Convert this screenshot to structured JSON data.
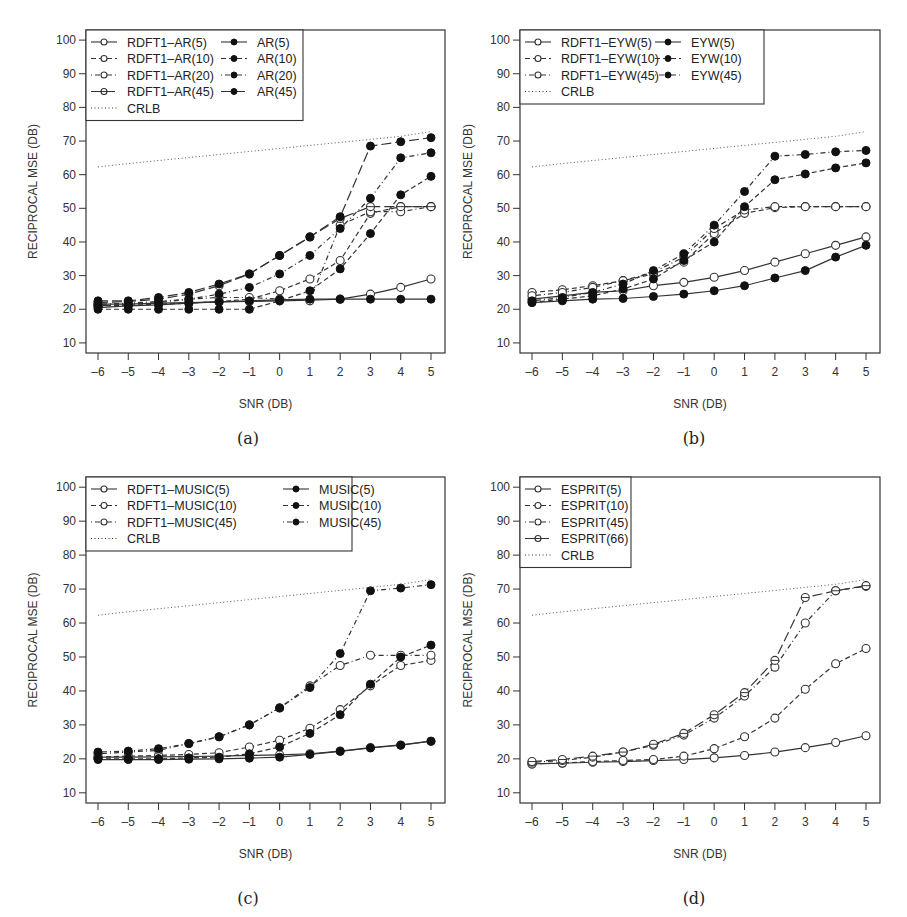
{
  "chart_data": [
    {
      "id": "a",
      "type": "line",
      "caption": "(a)",
      "xlabel": "SNR (DB)",
      "ylabel": "RECIPROCAL MSE (DB)",
      "x": [
        -6,
        -5,
        -4,
        -3,
        -2,
        -1,
        0,
        1,
        2,
        3,
        4,
        5
      ],
      "xticks": [
        "-6",
        "-5",
        "-4",
        "-3",
        "-2",
        "-1",
        "0",
        "1",
        "2",
        "3",
        "4",
        "5"
      ],
      "yticks": [
        "10",
        "20",
        "30",
        "40",
        "50",
        "60",
        "70",
        "80",
        "90",
        "100"
      ],
      "ylim": [
        7,
        103
      ],
      "grid": false,
      "legend_position": "top-left",
      "legend_columns": 2,
      "series": [
        {
          "name": "RDFT1-AR(5)",
          "marker": "open",
          "dash": "solid",
          "legend_col": 0,
          "legend_row": 0,
          "values": [
            21.5,
            21.5,
            21.8,
            22,
            22.2,
            22.3,
            22.5,
            22.7,
            23,
            24.5,
            26.5,
            29
          ]
        },
        {
          "name": "RDFT1-AR(10)",
          "marker": "open",
          "dash": "dashed",
          "legend_col": 0,
          "legend_row": 1,
          "values": [
            21,
            21.2,
            21.5,
            21.8,
            22.3,
            23,
            25.5,
            29,
            34.5,
            48.5,
            50.5,
            50.5
          ]
        },
        {
          "name": "RDFT1-AR(20)",
          "marker": "open",
          "dash": "dotdash",
          "legend_col": 0,
          "legend_row": 2,
          "values": [
            21.5,
            21.8,
            22.3,
            23,
            23.5,
            23.5,
            23,
            22.5,
            45,
            49,
            49,
            50.5
          ]
        },
        {
          "name": "RDFT1-AR(45)",
          "marker": "half",
          "dash": "longdash",
          "legend_col": 0,
          "legend_row": 3,
          "values": [
            22,
            22.3,
            23,
            24.5,
            27,
            30.5,
            36,
            41.5,
            47,
            50.5,
            50.5,
            50.5
          ]
        },
        {
          "name": "AR(5)",
          "marker": "filled",
          "dash": "solid",
          "legend_col": 1,
          "legend_row": 0,
          "values": [
            20.5,
            21,
            21.3,
            21.8,
            22.2,
            22.5,
            22.8,
            23,
            23,
            23,
            23,
            23
          ]
        },
        {
          "name": "AR(10)",
          "marker": "filled",
          "dash": "dashed",
          "legend_col": 1,
          "legend_row": 1,
          "values": [
            20,
            20,
            20,
            20,
            20,
            20,
            22.5,
            25.5,
            32,
            42.5,
            54,
            59.5
          ]
        },
        {
          "name": "AR(20)",
          "marker": "filled",
          "dash": "dotdash",
          "legend_col": 1,
          "legend_row": 2,
          "values": [
            21,
            21.5,
            22,
            23,
            24.5,
            26.5,
            30.5,
            36,
            44,
            53,
            65,
            66.5
          ]
        },
        {
          "name": "AR(45)",
          "marker": "filled",
          "dash": "longdash",
          "legend_col": 1,
          "legend_row": 3,
          "values": [
            22.5,
            22.5,
            23.5,
            25,
            27.5,
            30.5,
            36,
            41.5,
            47.5,
            68.5,
            69.8,
            71
          ]
        },
        {
          "name": "CRLB",
          "marker": "none",
          "dash": "dotted",
          "legend_col": 0,
          "legend_row": 4,
          "values": [
            62.3,
            63.3,
            64.2,
            65.1,
            66,
            66.9,
            67.8,
            68.7,
            69.6,
            70.5,
            71.4,
            72.8
          ]
        }
      ]
    },
    {
      "id": "b",
      "type": "line",
      "caption": "(b)",
      "xlabel": "SNR (DB)",
      "ylabel": "RECIPROCAL MSE (DB)",
      "x": [
        -6,
        -5,
        -4,
        -3,
        -2,
        -1,
        0,
        1,
        2,
        3,
        4,
        5
      ],
      "xticks": [
        "-6",
        "-5",
        "-4",
        "-3",
        "-2",
        "-1",
        "0",
        "1",
        "2",
        "3",
        "4",
        "5"
      ],
      "yticks": [
        "10",
        "20",
        "30",
        "40",
        "50",
        "60",
        "70",
        "80",
        "90",
        "100"
      ],
      "ylim": [
        7,
        103
      ],
      "grid": false,
      "legend_position": "top-left",
      "legend_columns": 2,
      "series": [
        {
          "name": "RDFT1-EYW(5)",
          "marker": "open",
          "dash": "solid",
          "legend_col": 0,
          "legend_row": 0,
          "values": [
            23,
            24,
            25,
            25.5,
            27,
            28,
            29.5,
            31.5,
            34,
            36.5,
            39,
            41.5
          ]
        },
        {
          "name": "RDFT1-EYW(10)",
          "marker": "open",
          "dash": "dashed",
          "legend_col": 0,
          "legend_row": 1,
          "values": [
            25,
            25.8,
            27,
            28.5,
            30.5,
            34,
            42.5,
            48.5,
            50.2,
            50.5,
            50.5,
            50.5
          ]
        },
        {
          "name": "RDFT1-EYW(45)",
          "marker": "open",
          "dash": "dotdash",
          "legend_col": 0,
          "legend_row": 2,
          "values": [
            24,
            25,
            26.5,
            28.5,
            31,
            35.5,
            44,
            49.5,
            50.5,
            50.5,
            50.5,
            50.5
          ]
        },
        {
          "name": "EYW(5)",
          "marker": "filled",
          "dash": "solid",
          "legend_col": 1,
          "legend_row": 0,
          "values": [
            22,
            22.5,
            23,
            23.2,
            23.8,
            24.5,
            25.5,
            27,
            29.3,
            31.5,
            35.5,
            39
          ]
        },
        {
          "name": "EYW(10)",
          "marker": "filled",
          "dash": "dashed",
          "legend_col": 1,
          "legend_row": 1,
          "values": [
            22,
            23,
            24,
            26,
            29,
            34.5,
            40,
            50.5,
            58.5,
            60.2,
            62,
            63.5
          ]
        },
        {
          "name": "EYW(45)",
          "marker": "filled",
          "dash": "dotdash",
          "legend_col": 1,
          "legend_row": 2,
          "values": [
            22.5,
            23.5,
            25,
            27.5,
            31.5,
            36.5,
            45,
            55,
            65.5,
            66,
            66.8,
            67.2
          ]
        },
        {
          "name": "CRLB",
          "marker": "none",
          "dash": "dotted",
          "legend_col": 0,
          "legend_row": 3,
          "values": [
            62.3,
            63.3,
            64.2,
            65.1,
            66,
            66.9,
            67.8,
            68.7,
            69.6,
            70.5,
            71.4,
            72.8
          ]
        }
      ]
    },
    {
      "id": "c",
      "type": "line",
      "caption": "(c)",
      "xlabel": "SNR (DB)",
      "ylabel": "RECIPROCAL MSE (DB)",
      "x": [
        -6,
        -5,
        -4,
        -3,
        -2,
        -1,
        0,
        1,
        2,
        3,
        4,
        5
      ],
      "xticks": [
        "-6",
        "-5",
        "-4",
        "-3",
        "-2",
        "-1",
        "0",
        "1",
        "2",
        "3",
        "4",
        "5"
      ],
      "yticks": [
        "10",
        "20",
        "30",
        "40",
        "50",
        "60",
        "70",
        "80",
        "90",
        "100"
      ],
      "ylim": [
        7,
        103
      ],
      "grid": false,
      "legend_position": "top-left",
      "legend_columns": 2,
      "series": [
        {
          "name": "RDFT1-MUSIC(5)",
          "marker": "open",
          "dash": "solid",
          "legend_col": 0,
          "legend_row": 0,
          "values": [
            20.5,
            20.5,
            20.6,
            20.7,
            20.8,
            21,
            21.2,
            21.5,
            22.3,
            23.3,
            24.1,
            25.2
          ]
        },
        {
          "name": "RDFT1-MUSIC(10)",
          "marker": "open",
          "dash": "dashed",
          "legend_col": 0,
          "legend_row": 1,
          "values": [
            20.5,
            20.8,
            21,
            21.3,
            21.8,
            23.5,
            25.5,
            29,
            34.5,
            41.5,
            47.5,
            49
          ]
        },
        {
          "name": "RDFT1-MUSIC(45)",
          "marker": "open",
          "dash": "dotdash",
          "legend_col": 0,
          "legend_row": 2,
          "values": [
            21.5,
            22,
            22.5,
            24.5,
            26.5,
            30,
            35,
            41.5,
            47.5,
            50.5,
            50.5,
            50.5
          ]
        },
        {
          "name": "MUSIC(5)",
          "marker": "filled",
          "dash": "solid",
          "legend_col": 1,
          "legend_row": 0,
          "values": [
            19.8,
            19.8,
            19.8,
            19.9,
            20,
            20.2,
            20.5,
            21.3,
            22.2,
            23.2,
            24,
            25.2
          ]
        },
        {
          "name": "MUSIC(10)",
          "marker": "filled",
          "dash": "dashed",
          "legend_col": 1,
          "legend_row": 1,
          "values": [
            20,
            20,
            20,
            20.3,
            20.5,
            21.5,
            23.5,
            27.5,
            33,
            42,
            50,
            53.5
          ]
        },
        {
          "name": "MUSIC(45)",
          "marker": "filled",
          "dash": "dotdash",
          "legend_col": 1,
          "legend_row": 2,
          "values": [
            22,
            22.3,
            23,
            24.5,
            26.5,
            30,
            35,
            41,
            51,
            69.5,
            70.3,
            71.3
          ]
        },
        {
          "name": "CRLB",
          "marker": "none",
          "dash": "dotted",
          "legend_col": 0,
          "legend_row": 3,
          "values": [
            62.3,
            63.3,
            64.2,
            65.1,
            66,
            66.9,
            67.8,
            68.7,
            69.6,
            70.5,
            71.4,
            72.8
          ]
        }
      ]
    },
    {
      "id": "d",
      "type": "line",
      "caption": "(d)",
      "xlabel": "SNR (DB)",
      "ylabel": "RECIPROCAL MSE (DB)",
      "x": [
        -6,
        -5,
        -4,
        -3,
        -2,
        -1,
        0,
        1,
        2,
        3,
        4,
        5
      ],
      "xticks": [
        "-6",
        "-5",
        "-4",
        "-3",
        "-2",
        "-1",
        "0",
        "1",
        "2",
        "3",
        "4",
        "5"
      ],
      "yticks": [
        "10",
        "20",
        "30",
        "40",
        "50",
        "60",
        "70",
        "80",
        "90",
        "100"
      ],
      "ylim": [
        7,
        103
      ],
      "grid": false,
      "legend_position": "top-left",
      "legend_columns": 1,
      "series": [
        {
          "name": "ESPRIT(5)",
          "marker": "open",
          "dash": "solid",
          "legend_col": 0,
          "legend_row": 0,
          "values": [
            18.5,
            18.7,
            19,
            19.2,
            19.5,
            19.8,
            20.3,
            21,
            22,
            23.3,
            24.8,
            26.8
          ]
        },
        {
          "name": "ESPRIT(10)",
          "marker": "open",
          "dash": "dashed",
          "legend_col": 0,
          "legend_row": 1,
          "values": [
            18.5,
            18.8,
            19.2,
            19.5,
            19.8,
            20.8,
            23,
            26.5,
            32,
            40.5,
            48,
            52.5
          ]
        },
        {
          "name": "ESPRIT(45)",
          "marker": "open",
          "dash": "dotdash",
          "legend_col": 0,
          "legend_row": 2,
          "values": [
            19,
            19.5,
            20.5,
            22,
            24,
            27,
            32,
            38.5,
            47,
            60,
            69.5,
            70.8
          ]
        },
        {
          "name": "ESPRIT(66)",
          "marker": "half",
          "dash": "longdash",
          "legend_col": 0,
          "legend_row": 3,
          "values": [
            19.2,
            19.8,
            20.8,
            22,
            24.3,
            27.5,
            33,
            39.5,
            49,
            67.5,
            69.5,
            71
          ]
        },
        {
          "name": "CRLB",
          "marker": "none",
          "dash": "dotted",
          "legend_col": 0,
          "legend_row": 4,
          "values": [
            62.3,
            63.3,
            64.2,
            65.1,
            66,
            66.9,
            67.8,
            68.7,
            69.6,
            70.5,
            71.4,
            72.8
          ]
        }
      ]
    }
  ]
}
